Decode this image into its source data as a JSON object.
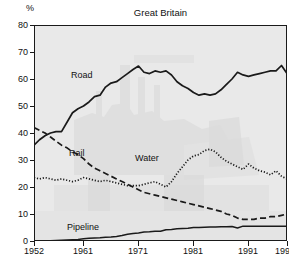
{
  "chart_data": {
    "type": "line",
    "title": "Great Britain",
    "ylabel": "%",
    "xlabel": "",
    "ylim": [
      0,
      80
    ],
    "xlim": [
      1952,
      1998
    ],
    "yticks": [
      0,
      10,
      20,
      30,
      40,
      50,
      60,
      70,
      80
    ],
    "xticks": [
      1952,
      1961,
      1971,
      1981,
      1991,
      1998
    ],
    "grid": false,
    "legend_position": "inline-annotations",
    "x": [
      1952,
      1953,
      1954,
      1955,
      1956,
      1957,
      1958,
      1959,
      1960,
      1961,
      1962,
      1963,
      1964,
      1965,
      1966,
      1967,
      1968,
      1969,
      1970,
      1971,
      1972,
      1973,
      1974,
      1975,
      1976,
      1977,
      1978,
      1979,
      1980,
      1981,
      1982,
      1983,
      1984,
      1985,
      1986,
      1987,
      1988,
      1989,
      1990,
      1991,
      1992,
      1993,
      1994,
      1995,
      1996,
      1997,
      1998
    ],
    "series": [
      {
        "name": "Road",
        "style": "solid",
        "color": "#1a1a1a",
        "values": [
          35.5,
          37.5,
          39.0,
          40.0,
          40.5,
          40.5,
          44.0,
          47.5,
          49.0,
          50.0,
          51.5,
          53.5,
          54.0,
          57.0,
          58.5,
          59.0,
          60.5,
          62.0,
          63.5,
          64.8,
          62.5,
          62.0,
          63.0,
          62.5,
          63.0,
          61.5,
          59.0,
          57.5,
          56.5,
          55.0,
          54.0,
          54.5,
          54.0,
          54.5,
          56.0,
          58.0,
          60.0,
          62.5,
          61.5,
          61.0,
          61.5,
          62.0,
          62.5,
          63.0,
          63.0,
          65.0,
          62.0
        ]
      },
      {
        "name": "Rail",
        "style": "dashed",
        "color": "#1a1a1a",
        "values": [
          42.0,
          41.0,
          40.0,
          38.5,
          37.0,
          35.5,
          34.5,
          33.0,
          32.0,
          30.5,
          28.5,
          27.0,
          26.0,
          25.0,
          24.0,
          23.0,
          22.0,
          21.0,
          20.0,
          19.0,
          18.0,
          17.5,
          17.0,
          16.5,
          16.0,
          15.5,
          15.0,
          14.5,
          14.0,
          13.5,
          13.0,
          12.5,
          12.0,
          11.5,
          11.0,
          10.0,
          9.5,
          8.5,
          8.0,
          8.0,
          8.0,
          8.5,
          8.5,
          9.0,
          9.0,
          9.5,
          10.0
        ]
      },
      {
        "name": "Water",
        "style": "dotted",
        "color": "#1a1a1a",
        "values": [
          23.5,
          23.0,
          23.5,
          23.0,
          22.5,
          23.0,
          22.5,
          22.0,
          22.5,
          23.5,
          23.0,
          22.5,
          22.0,
          22.5,
          22.0,
          21.5,
          21.0,
          20.5,
          20.5,
          20.5,
          21.0,
          21.5,
          22.0,
          21.0,
          20.0,
          22.0,
          25.0,
          27.5,
          30.0,
          31.5,
          32.0,
          33.5,
          34.0,
          33.0,
          31.0,
          29.5,
          28.5,
          27.5,
          26.5,
          28.5,
          27.0,
          26.0,
          25.5,
          24.5,
          26.0,
          24.0,
          23.0
        ]
      },
      {
        "name": "Pipeline",
        "style": "solid-thin",
        "color": "#1a1a1a",
        "values": [
          0.0,
          0.0,
          0.0,
          0.1,
          0.2,
          0.3,
          0.4,
          0.5,
          0.6,
          0.8,
          1.0,
          1.1,
          1.2,
          1.4,
          1.5,
          1.7,
          2.0,
          2.5,
          2.8,
          3.0,
          3.3,
          3.4,
          3.6,
          3.6,
          4.2,
          4.3,
          4.5,
          4.6,
          4.7,
          5.0,
          5.0,
          5.1,
          5.2,
          5.2,
          5.3,
          5.3,
          5.4,
          4.8,
          5.5,
          5.5,
          5.5,
          5.5,
          5.5,
          5.5,
          5.5,
          5.5,
          5.5
        ]
      }
    ],
    "annotations": [
      {
        "text": "Road",
        "series": "Road"
      },
      {
        "text": "Rail",
        "series": "Rail"
      },
      {
        "text": "Water",
        "series": "Water"
      },
      {
        "text": "Pipeline",
        "series": "Pipeline"
      }
    ]
  },
  "labels": {
    "y0": "0",
    "y10": "10",
    "y20": "20",
    "y30": "30",
    "y40": "40",
    "y50": "50",
    "y60": "60",
    "y70": "70",
    "y80": "80",
    "x0": "1952",
    "x1": "1961",
    "x2": "1971",
    "x3": "1981",
    "x4": "1991",
    "x5": "1998"
  }
}
